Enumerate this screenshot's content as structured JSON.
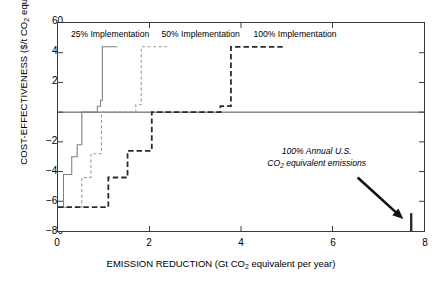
{
  "chart_data": {
    "type": "line",
    "title": "",
    "xlabel": "EMISSION REDUCTION (Gt CO2 equivalent per year)",
    "xlabel_main": "EMISSION REDUCTION (Gt CO",
    "xlabel_sub": "2",
    "xlabel_tail": " equivalent per year)",
    "ylabel": "COST-EFFECTIVENESS ($/t CO2 equivalent)",
    "ylabel_main": "COST-EFFECTIVENESS ($/t CO",
    "ylabel_sub": "2",
    "ylabel_tail": " equivalent)",
    "xlim": [
      0,
      8
    ],
    "ylim": [
      -80,
      60
    ],
    "xticks": [
      0,
      2,
      4,
      6,
      8
    ],
    "yticks": [
      60,
      40,
      20,
      0,
      -20,
      -40,
      -60,
      -80
    ],
    "grid": false,
    "legend_position": "in-plot-top",
    "zero_line": 0,
    "series": [
      {
        "name": "25% Implementation",
        "style": "solid",
        "color": "#808080",
        "label_x": 0.28,
        "label_y": 52,
        "points": [
          [
            0.0,
            -64
          ],
          [
            0.12,
            -64
          ],
          [
            0.12,
            -42
          ],
          [
            0.3,
            -42
          ],
          [
            0.3,
            -30
          ],
          [
            0.42,
            -30
          ],
          [
            0.42,
            -22
          ],
          [
            0.52,
            -22
          ],
          [
            0.52,
            0
          ],
          [
            0.86,
            0
          ],
          [
            0.86,
            4
          ],
          [
            0.93,
            4
          ],
          [
            0.93,
            8
          ],
          [
            0.97,
            8
          ],
          [
            0.97,
            44
          ],
          [
            1.3,
            44
          ]
        ]
      },
      {
        "name": "50% Implementation",
        "style": "dashed-fine",
        "color": "#9a9a9a",
        "label_x": 2.25,
        "label_y": 52,
        "points": [
          [
            0.0,
            -64
          ],
          [
            0.52,
            -64
          ],
          [
            0.52,
            -44
          ],
          [
            0.72,
            -44
          ],
          [
            0.72,
            -28
          ],
          [
            0.95,
            -28
          ],
          [
            0.95,
            0
          ],
          [
            1.7,
            0
          ],
          [
            1.7,
            5
          ],
          [
            1.82,
            5
          ],
          [
            1.82,
            44
          ],
          [
            2.45,
            44
          ]
        ]
      },
      {
        "name": "100% Implementation",
        "style": "dashed-bold",
        "color": "#2b2b2b",
        "label_x": 4.25,
        "label_y": 52,
        "points": [
          [
            0.0,
            -64
          ],
          [
            1.1,
            -64
          ],
          [
            1.1,
            -44
          ],
          [
            1.52,
            -44
          ],
          [
            1.52,
            -26
          ],
          [
            2.05,
            -26
          ],
          [
            2.05,
            0
          ],
          [
            3.55,
            0
          ],
          [
            3.55,
            4
          ],
          [
            3.78,
            4
          ],
          [
            3.78,
            44
          ],
          [
            4.95,
            44
          ]
        ]
      }
    ],
    "annotation": {
      "line1": "100% Annual U.S.",
      "line2_main": "CO",
      "line2_sub": "2",
      "line2_tail": " equivalent emissions",
      "marker_x": 7.72,
      "marker_top": -68,
      "marker_bottom": -80,
      "arrow_from": [
        6.55,
        -44
      ],
      "arrow_to": [
        7.55,
        -72
      ]
    }
  },
  "axis": {
    "ytick_labels": [
      "60",
      "40",
      "20",
      "0",
      "−20",
      "−40",
      "−60",
      "−80"
    ],
    "xtick_labels": [
      "0",
      "2",
      "4",
      "6",
      "8"
    ]
  }
}
